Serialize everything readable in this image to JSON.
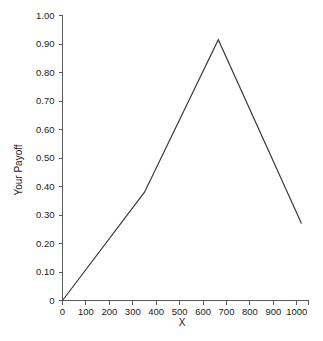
{
  "chart_data": {
    "type": "line",
    "title": "",
    "subtitle": "",
    "xlabel": "X",
    "ylabel": "Your Payoff",
    "xlim": [
      0,
      1050
    ],
    "ylim": [
      0,
      1.0
    ],
    "grid": false,
    "legend": false,
    "legend_position": "none",
    "line_color": "#3a3a3a",
    "axis_color": "#5a5a5a",
    "background_color": "#ffffff",
    "x_ticks": [
      0,
      100,
      200,
      300,
      400,
      500,
      600,
      700,
      800,
      900,
      1000
    ],
    "x_tick_labels": [
      "0",
      "100",
      "200",
      "300",
      "400",
      "500",
      "600",
      "700",
      "800",
      "900",
      "1000"
    ],
    "y_ticks": [
      0,
      0.1,
      0.2,
      0.3,
      0.4,
      0.5,
      0.6,
      0.7,
      0.8,
      0.9,
      1.0
    ],
    "y_tick_labels": [
      "0",
      "0.10",
      "0.20",
      "0.30",
      "0.40",
      "0.50",
      "0.60",
      "0.70",
      "0.80",
      "0.90",
      "1.00"
    ],
    "series": [
      {
        "name": "Your Payoff",
        "x": [
          0,
          350,
          665,
          1020
        ],
        "values": [
          0.0,
          0.38,
          0.915,
          0.27
        ]
      }
    ],
    "annotations": []
  }
}
